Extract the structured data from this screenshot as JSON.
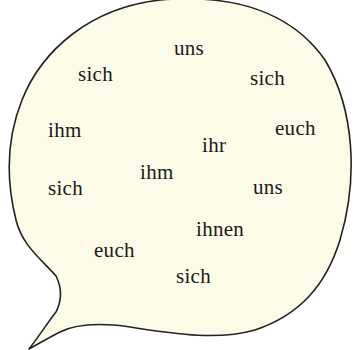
{
  "bubble": {
    "fill": "#fcfbe8",
    "stroke": "#222222"
  },
  "words": [
    {
      "text": "uns",
      "x": 174,
      "y": 38
    },
    {
      "text": "sich",
      "x": 78,
      "y": 64
    },
    {
      "text": "sich",
      "x": 250,
      "y": 68
    },
    {
      "text": "ihm",
      "x": 48,
      "y": 120
    },
    {
      "text": "euch",
      "x": 275,
      "y": 118
    },
    {
      "text": "ihr",
      "x": 202,
      "y": 135
    },
    {
      "text": "ihm",
      "x": 140,
      "y": 162
    },
    {
      "text": "sich",
      "x": 48,
      "y": 178
    },
    {
      "text": "uns",
      "x": 253,
      "y": 177
    },
    {
      "text": "ihnen",
      "x": 196,
      "y": 219
    },
    {
      "text": "euch",
      "x": 94,
      "y": 240
    },
    {
      "text": "sich",
      "x": 176,
      "y": 266
    }
  ]
}
